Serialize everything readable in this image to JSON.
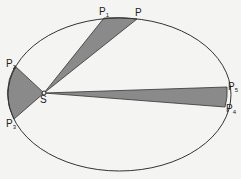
{
  "diagram": {
    "colors": {
      "background": "#f4f4f2",
      "stroke": "#333333",
      "fill": "#8a8a8a"
    },
    "focus": {
      "label": "S",
      "x": 44,
      "y": 93
    },
    "orbit": {
      "cx": 119.5,
      "cy": 94.5,
      "rx": 111.5,
      "ry": 76.5
    },
    "points": [
      {
        "id": "P1",
        "base": "P",
        "sub": "1",
        "x": 104,
        "y": 18,
        "lx": 99,
        "ly": 15
      },
      {
        "id": "P",
        "base": "P",
        "sub": "",
        "x": 137,
        "y": 19,
        "lx": 135,
        "ly": 16
      },
      {
        "id": "P2",
        "base": "P",
        "sub": "2",
        "x": 15,
        "y": 66,
        "lx": 6,
        "ly": 67
      },
      {
        "id": "P3",
        "base": "P",
        "sub": "3",
        "x": 14,
        "y": 119,
        "lx": 6,
        "ly": 127
      },
      {
        "id": "P5",
        "base": "P",
        "sub": "5",
        "x": 227,
        "y": 87,
        "lx": 228,
        "ly": 90
      },
      {
        "id": "P4",
        "base": "P",
        "sub": "4",
        "x": 225,
        "y": 107,
        "lx": 226,
        "ly": 112
      }
    ],
    "sectors": [
      {
        "name": "top-sector",
        "from": "P1",
        "to": "P"
      },
      {
        "name": "left-sector",
        "from": "P2",
        "to": "P3"
      },
      {
        "name": "right-sector",
        "from": "P5",
        "to": "P4"
      }
    ]
  }
}
